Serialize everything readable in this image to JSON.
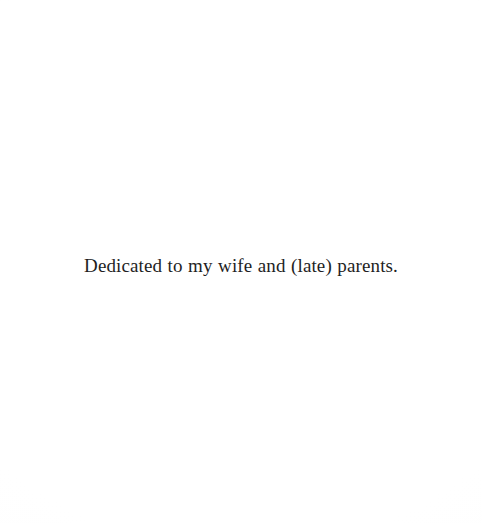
{
  "page": {
    "kind": "book-dedication-page",
    "width": 482,
    "height": 523,
    "background_color": "#fefefe",
    "text_color": "#1f1f1f"
  },
  "dedication": {
    "text": "Dedicated to my wife and (late) parents."
  }
}
